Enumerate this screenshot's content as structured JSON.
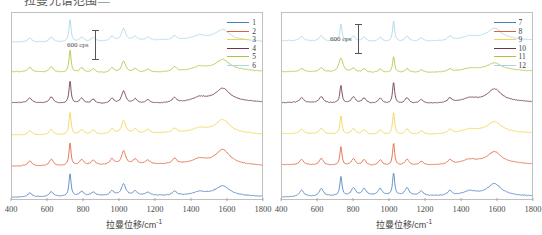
{
  "page": {
    "clipped_heading": "拉曼光谱范围—"
  },
  "chart_data": [
    {
      "type": "line",
      "panel": "left",
      "title": "",
      "xlabel": "拉曼位移/cm",
      "xlabel_sup": "-1",
      "ylabel": "",
      "xlim": [
        400,
        1800
      ],
      "xticks": [
        400,
        600,
        800,
        1000,
        1200,
        1400,
        1600,
        1800
      ],
      "grid": false,
      "legend_position": "top-right",
      "scalebar": {
        "label": "600 cps",
        "value": 600,
        "unit": "cps"
      },
      "annotation_note": "Stacked/offset Raman spectra, intensity axis not numerically labelled",
      "series": [
        {
          "name": "1",
          "color": "#4a7ebb",
          "offset": 5,
          "peaks_cm1": [
            500,
            620,
            725,
            790,
            855,
            960,
            1025,
            1090,
            1160,
            1310,
            1450,
            1580
          ],
          "peak_heights": [
            0.18,
            0.22,
            1.0,
            0.2,
            0.16,
            0.2,
            0.52,
            0.18,
            0.14,
            0.18,
            0.14,
            0.4
          ]
        },
        {
          "name": "2",
          "color": "#e0603c",
          "offset": 4,
          "peaks_cm1": [
            500,
            620,
            725,
            790,
            855,
            960,
            1025,
            1090,
            1160,
            1310,
            1450,
            1580
          ],
          "peak_heights": [
            0.24,
            0.3,
            1.0,
            0.26,
            0.22,
            0.26,
            0.6,
            0.22,
            0.18,
            0.24,
            0.2,
            0.62
          ]
        },
        {
          "name": "3",
          "color": "#f2d34a",
          "offset": 3,
          "peaks_cm1": [
            500,
            620,
            725,
            790,
            855,
            960,
            1025,
            1090,
            1160,
            1310,
            1450,
            1580
          ],
          "peak_heights": [
            0.2,
            0.26,
            1.0,
            0.22,
            0.2,
            0.22,
            0.58,
            0.2,
            0.16,
            0.2,
            0.18,
            0.56
          ]
        },
        {
          "name": "4",
          "color": "#6b3350",
          "offset": 2,
          "peaks_cm1": [
            500,
            620,
            725,
            790,
            855,
            960,
            1025,
            1090,
            1160,
            1310,
            1450,
            1580
          ],
          "peak_heights": [
            0.22,
            0.28,
            1.0,
            0.24,
            0.2,
            0.24,
            0.56,
            0.2,
            0.16,
            0.22,
            0.18,
            0.54
          ]
        },
        {
          "name": "5",
          "color": "#b3c13e",
          "offset": 1,
          "peaks_cm1": [
            500,
            620,
            725,
            790,
            855,
            960,
            1025,
            1090,
            1160,
            1310,
            1450,
            1580
          ],
          "peak_heights": [
            0.2,
            0.24,
            1.0,
            0.22,
            0.18,
            0.22,
            0.52,
            0.18,
            0.14,
            0.2,
            0.16,
            0.44
          ]
        },
        {
          "name": "6",
          "color": "#a8d5e8",
          "offset": 0,
          "peaks_cm1": [
            500,
            620,
            725,
            790,
            855,
            960,
            1025,
            1090,
            1160,
            1310,
            1450,
            1580
          ],
          "peak_heights": [
            0.18,
            0.22,
            1.0,
            0.2,
            0.16,
            0.2,
            0.54,
            0.18,
            0.14,
            0.18,
            0.16,
            0.42
          ]
        }
      ]
    },
    {
      "type": "line",
      "panel": "right",
      "title": "",
      "xlabel": "拉曼位移/cm",
      "xlabel_sup": "-1",
      "ylabel": "",
      "xlim": [
        400,
        1800
      ],
      "xticks": [
        400,
        600,
        800,
        1000,
        1200,
        1400,
        1600,
        1800
      ],
      "grid": false,
      "legend_position": "top-right",
      "scalebar": {
        "label": "600 cps",
        "value": 600,
        "unit": "cps"
      },
      "annotation_note": "Stacked/offset Raman spectra, intensity axis not numerically labelled",
      "series": [
        {
          "name": "7",
          "color": "#4a7ebb",
          "offset": 5,
          "peaks_cm1": [
            510,
            620,
            730,
            800,
            860,
            950,
            1025,
            1100,
            1180,
            1340,
            1450,
            1590
          ],
          "peak_heights": [
            0.3,
            0.34,
            0.86,
            0.34,
            0.3,
            0.3,
            1.0,
            0.34,
            0.2,
            0.22,
            0.18,
            0.5
          ]
        },
        {
          "name": "8",
          "color": "#e0603c",
          "offset": 4,
          "peaks_cm1": [
            510,
            620,
            730,
            800,
            860,
            950,
            1025,
            1100,
            1180,
            1340,
            1450,
            1590
          ],
          "peak_heights": [
            0.24,
            0.3,
            0.84,
            0.3,
            0.26,
            0.26,
            1.0,
            0.28,
            0.18,
            0.2,
            0.16,
            0.48
          ]
        },
        {
          "name": "9",
          "color": "#f2d34a",
          "offset": 3,
          "peaks_cm1": [
            510,
            620,
            730,
            800,
            860,
            950,
            1025,
            1100,
            1180,
            1340,
            1450,
            1590
          ],
          "peak_heights": [
            0.2,
            0.26,
            0.82,
            0.26,
            0.22,
            0.22,
            1.0,
            0.26,
            0.16,
            0.18,
            0.14,
            0.44
          ]
        },
        {
          "name": "10",
          "color": "#6b3350",
          "offset": 2,
          "peaks_cm1": [
            510,
            620,
            730,
            800,
            860,
            950,
            1025,
            1100,
            1180,
            1340,
            1450,
            1590
          ],
          "peak_heights": [
            0.22,
            0.28,
            0.8,
            0.28,
            0.24,
            0.24,
            0.96,
            0.26,
            0.18,
            0.2,
            0.16,
            0.52
          ]
        },
        {
          "name": "11",
          "color": "#b3c13e",
          "offset": 1,
          "peaks_cm1": [
            510,
            620,
            730,
            800,
            860,
            950,
            1025,
            1100,
            1180,
            1340,
            1450,
            1590
          ],
          "peak_heights": [
            0.14,
            0.18,
            0.64,
            0.18,
            0.16,
            0.16,
            0.74,
            0.18,
            0.12,
            0.12,
            0.1,
            0.3
          ]
        },
        {
          "name": "12",
          "color": "#a8d5e8",
          "offset": 0,
          "peaks_cm1": [
            510,
            620,
            730,
            800,
            860,
            950,
            1025,
            1100,
            1180,
            1340,
            1450,
            1590
          ],
          "peak_heights": [
            0.2,
            0.24,
            0.78,
            0.24,
            0.2,
            0.2,
            0.92,
            0.24,
            0.16,
            0.18,
            0.14,
            0.46
          ]
        }
      ]
    }
  ]
}
